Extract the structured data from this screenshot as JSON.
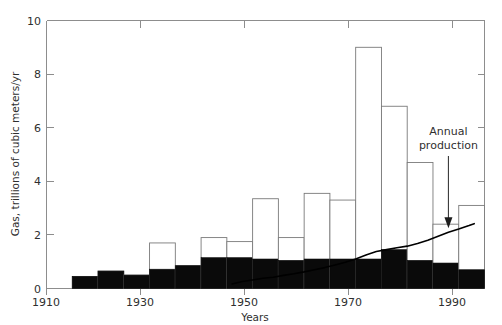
{
  "chart_data": {
    "type": "bar",
    "title": "",
    "subtitle": "",
    "xlabel": "Years",
    "ylabel": "Gas, trillions of cubic meters/yr",
    "xlim": [
      1910,
      1995
    ],
    "ylim": [
      0,
      10
    ],
    "xticks": [
      1910,
      1930,
      1950,
      1970,
      1990
    ],
    "xticklabels": [
      "1910",
      "1930",
      "1950",
      "1970",
      "1990"
    ],
    "xminorticks": [
      1920,
      1940,
      1960,
      1980
    ],
    "yticks": [
      0,
      2,
      4,
      6,
      8,
      10
    ],
    "yticklabels": [
      "0",
      "2",
      "4",
      "6",
      "8",
      "10"
    ],
    "yminorticks": [
      1,
      3,
      5,
      7,
      9
    ],
    "grid": false,
    "legend": "none",
    "bar_width_years": 5,
    "series": [
      {
        "name": "Discoveries (total, white stacked top)",
        "type": "bar",
        "color": "#ffffff",
        "edgecolor": "#7a7a7a",
        "categories": [
          "1915",
          "1920",
          "1925",
          "1930",
          "1935",
          "1940",
          "1945",
          "1950",
          "1955",
          "1960",
          "1965",
          "1970",
          "1975",
          "1980",
          "1985",
          "1990"
        ],
        "values": [
          0.45,
          0.65,
          0.5,
          1.7,
          0.85,
          1.9,
          1.75,
          3.35,
          1.9,
          3.55,
          3.3,
          9.0,
          6.8,
          4.7,
          2.4,
          3.1
        ]
      },
      {
        "name": "Cumulative production (black stacked base)",
        "type": "bar",
        "color": "#0a0a0a",
        "edgecolor": "#0a0a0a",
        "categories": [
          "1915",
          "1920",
          "1925",
          "1930",
          "1935",
          "1940",
          "1945",
          "1950",
          "1955",
          "1960",
          "1965",
          "1970",
          "1975",
          "1980",
          "1985",
          "1990"
        ],
        "values": [
          0.45,
          0.65,
          0.5,
          0.72,
          0.85,
          1.15,
          1.15,
          1.1,
          1.05,
          1.1,
          1.1,
          1.1,
          1.45,
          1.05,
          0.95,
          0.7
        ]
      },
      {
        "name": "Annual production",
        "type": "line",
        "color": "#000000",
        "x": [
          1946,
          1948,
          1950,
          1952,
          1954,
          1956,
          1958,
          1960,
          1962,
          1964,
          1966,
          1968,
          1970,
          1972,
          1974,
          1976,
          1978,
          1980,
          1982,
          1984,
          1986,
          1988,
          1990,
          1992,
          1993
        ],
        "values": [
          0.17,
          0.26,
          0.32,
          0.38,
          0.42,
          0.49,
          0.55,
          0.62,
          0.7,
          0.78,
          0.88,
          0.98,
          1.1,
          1.25,
          1.38,
          1.45,
          1.52,
          1.58,
          1.68,
          1.8,
          1.95,
          2.1,
          2.22,
          2.35,
          2.42
        ]
      }
    ],
    "annotations": [
      {
        "text_line1": "Annual",
        "text_line2": "production",
        "target_x": 1988,
        "target_y": 2.1,
        "arrow": "down-arrow"
      }
    ]
  },
  "axis": {
    "y_title": "Gas, trillions of cubic meters/yr",
    "x_title": "Years",
    "y_labels": [
      "10",
      "8",
      "6",
      "4",
      "2",
      "0"
    ],
    "x_labels": [
      "1910",
      "1930",
      "1950",
      "1970",
      "1990"
    ]
  },
  "annotation": {
    "line1": "Annual",
    "line2": "production"
  },
  "colors": {
    "bar_fill_reserve": "#ffffff",
    "bar_edge_reserve": "#7a7a7a",
    "bar_fill_cumulative": "#0a0a0a",
    "line_color": "#000000",
    "axis_color": "#8d8d8d",
    "text_color": "#2f2f2f",
    "background": "#ffffff"
  }
}
